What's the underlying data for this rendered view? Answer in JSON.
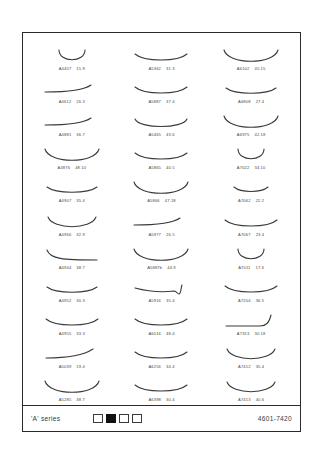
{
  "sheet": {
    "footer": {
      "series_label": "'A' series",
      "catalog_number": "4601-7420",
      "swatches": [
        {
          "name": "swatch-1",
          "filled": false
        },
        {
          "name": "swatch-2",
          "filled": true
        },
        {
          "name": "swatch-3",
          "filled": false
        },
        {
          "name": "swatch-4",
          "filled": false
        }
      ]
    }
  },
  "chart_data": {
    "type": "table",
    "title": "'A' series",
    "columns": 3,
    "rows": 11,
    "xlabel": "",
    "ylabel": "",
    "legend": [],
    "grid": false,
    "items": [
      {
        "code": "A4457",
        "size": "15.9",
        "shape": "deep-u-narrow"
      },
      {
        "code": "A5362",
        "size": "31.3",
        "shape": "shallow-wide"
      },
      {
        "code": "A6102",
        "size": "45.15",
        "shape": "deep-u-wide"
      },
      {
        "code": "A4612",
        "size": "26.3",
        "shape": "flat-hook-right"
      },
      {
        "code": "A5887",
        "size": "37.4",
        "shape": "shallow-wide"
      },
      {
        "code": "A6808",
        "size": "27.4",
        "shape": "shallow-curved"
      },
      {
        "code": "A4881",
        "size": "36.7",
        "shape": "flat-hook-right"
      },
      {
        "code": "A5465",
        "size": "43.6",
        "shape": "shallow-wide-hooked"
      },
      {
        "code": "A6975",
        "size": "42.18",
        "shape": "deep-u-wide"
      },
      {
        "code": "A4876",
        "size": "48.10",
        "shape": "deep-u-wide"
      },
      {
        "code": "A5865",
        "size": "40.5",
        "shape": "shallow-wide"
      },
      {
        "code": "A7022",
        "size": "34.10",
        "shape": "deep-u-narrow"
      },
      {
        "code": "A4907",
        "size": "35.4",
        "shape": "shallow-curved"
      },
      {
        "code": "A5866",
        "size": "47.18",
        "shape": "deep-u-wide"
      },
      {
        "code": "A7062",
        "size": "22.2",
        "shape": "shallow-shortwide"
      },
      {
        "code": "A4966",
        "size": "32.9",
        "shape": "medium-u"
      },
      {
        "code": "A5977",
        "size": "26.5",
        "shape": "flat-hook-right"
      },
      {
        "code": "A7067",
        "size": "23.4",
        "shape": "shallow-wide"
      },
      {
        "code": "A4944",
        "size": "38.7",
        "shape": "steep-left-flat"
      },
      {
        "code": "A5887b",
        "size": "44.9",
        "shape": "deep-u-wide"
      },
      {
        "code": "A7011",
        "size": "17.6",
        "shape": "deep-u-narrow"
      },
      {
        "code": "A4952",
        "size": "30.3",
        "shape": "shallow-curved"
      },
      {
        "code": "A5916",
        "size": "35.4",
        "shape": "flat-notch-right"
      },
      {
        "code": "A7204",
        "size": "36.5",
        "shape": "shallow-wide"
      },
      {
        "code": "A4955",
        "size": "33.3",
        "shape": "shallow-wide"
      },
      {
        "code": "A6016",
        "size": "48.4",
        "shape": "shallow-wide"
      },
      {
        "code": "A7313",
        "size": "30.18",
        "shape": "flat-sharp-hook"
      },
      {
        "code": "A5039",
        "size": "19.4",
        "shape": "flat-rise-right"
      },
      {
        "code": "A6256",
        "size": "34.4",
        "shape": "shallow-wide"
      },
      {
        "code": "A7412",
        "size": "35.4",
        "shape": "medium-u"
      },
      {
        "code": "A5285",
        "size": "38.7",
        "shape": "deep-u-wide"
      },
      {
        "code": "A6398",
        "size": "30.4",
        "shape": "shallow-wide"
      },
      {
        "code": "A7413",
        "size": "40.6",
        "shape": "medium-u"
      }
    ]
  }
}
